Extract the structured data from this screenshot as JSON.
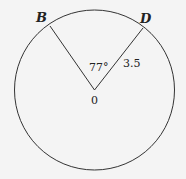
{
  "diagram": {
    "points": {
      "B": {
        "label": "B"
      },
      "D": {
        "label": "D"
      },
      "center": {
        "label": "0"
      }
    },
    "angle_label": "77°",
    "radius_label": "3.5",
    "colors": {
      "stroke": "#333333",
      "background": "#f4f4f4"
    }
  }
}
